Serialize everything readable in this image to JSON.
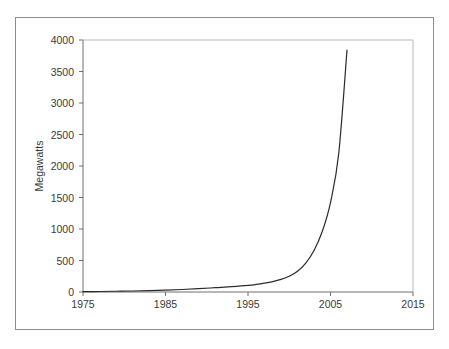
{
  "chart_data": {
    "type": "line",
    "title": "",
    "subtitle": "",
    "xlabel": "",
    "ylabel": "Megawatts",
    "xlim": [
      1975,
      2015
    ],
    "ylim": [
      0,
      4000
    ],
    "grid": false,
    "legend": false,
    "legend_position": "none",
    "x_ticks": [
      "1975",
      "1985",
      "1995",
      "2005",
      "2015"
    ],
    "y_ticks": [
      "0",
      "500",
      "1000",
      "1500",
      "2000",
      "2500",
      "3000",
      "3500",
      "4000"
    ],
    "series": [
      {
        "name": "Installed capacity",
        "color": "#2b2b2b",
        "x": [
          1975,
          1977,
          1979,
          1981,
          1983,
          1985,
          1987,
          1989,
          1991,
          1993,
          1995,
          1996,
          1997,
          1998,
          1999,
          2000,
          2001,
          2002,
          2003,
          2004,
          2005,
          2006,
          2007
        ],
        "values": [
          5,
          8,
          12,
          16,
          22,
          30,
          40,
          52,
          68,
          85,
          105,
          120,
          140,
          165,
          200,
          250,
          330,
          460,
          660,
          960,
          1420,
          2200,
          3840
        ]
      }
    ],
    "annotations": []
  },
  "figure": {
    "background_color": "#ffffff",
    "frame_color": "#8d8d8d",
    "axis_color": "#6e6e6e",
    "text_color": "#3a3a3a"
  }
}
